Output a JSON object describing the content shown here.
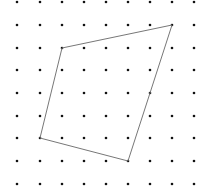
{
  "canvas": {
    "width": 212,
    "height": 187,
    "background": "#ffffff"
  },
  "grid": {
    "columns_x": [
      17,
      40,
      62,
      84,
      106,
      128,
      150,
      172,
      194
    ],
    "rows_y": [
      2,
      25,
      48,
      70,
      93,
      116,
      138,
      161,
      184
    ],
    "dot_radius": 1.3,
    "dot_color": "#111111"
  },
  "shape": {
    "type": "quadrilateral",
    "vertices": [
      [
        62,
        48
      ],
      [
        172,
        25
      ],
      [
        128,
        161
      ],
      [
        40,
        138
      ]
    ],
    "stroke_color": "#777777",
    "stroke_width": 1
  }
}
